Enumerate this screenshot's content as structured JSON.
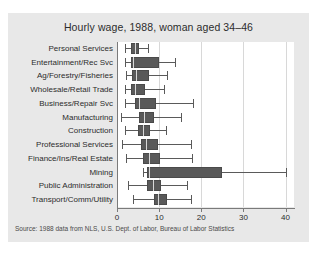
{
  "chart_data": {
    "type": "box",
    "title": "Hourly wage, 1988, woman aged 34–46",
    "xlabel": "",
    "ylabel": "",
    "xlim": [
      0,
      42
    ],
    "xticks": [
      0,
      10,
      20,
      30,
      40
    ],
    "xtick_labels": [
      "0",
      "10",
      "20",
      "30",
      "40"
    ],
    "grid": true,
    "grid_axis": "x",
    "legend": "none",
    "source_note": "Source: 1988 data from NLS, U.S. Dept. of Labor, Bureau of Labor Statistics",
    "categories": [
      "Personal Services",
      "Entertainment/Rec Svc",
      "Ag/Forestry/Fisheries",
      "Wholesale/Retail Trade",
      "Business/Repair Svc",
      "Manufacturing",
      "Construction",
      "Professional Services",
      "Finance/Ins/Real Estate",
      "Mining",
      "Public Administration",
      "Transport/Comm/Utility"
    ],
    "boxes": [
      {
        "category": "Personal Services",
        "whisker_low": 2.0,
        "q1": 3.4,
        "median": 4.3,
        "q3": 5.2,
        "whisker_high": 7.3
      },
      {
        "category": "Entertainment/Rec Svc",
        "whisker_low": 2.0,
        "q1": 3.3,
        "median": 3.7,
        "q3": 9.9,
        "whisker_high": 13.8
      },
      {
        "category": "Ag/Forestry/Fisheries",
        "whisker_low": 2.1,
        "q1": 3.6,
        "median": 4.4,
        "q3": 7.6,
        "whisker_high": 11.9
      },
      {
        "category": "Wholesale/Retail Trade",
        "whisker_low": 1.8,
        "q1": 3.4,
        "median": 4.3,
        "q3": 6.6,
        "whisker_high": 11.2
      },
      {
        "category": "Business/Repair Svc",
        "whisker_low": 1.8,
        "q1": 4.3,
        "median": 5.2,
        "q3": 9.3,
        "whisker_high": 18.0
      },
      {
        "category": "Manufacturing",
        "whisker_low": 0.9,
        "q1": 5.2,
        "median": 6.4,
        "q3": 8.7,
        "whisker_high": 15.1
      },
      {
        "category": "Construction",
        "whisker_low": 1.9,
        "q1": 5.1,
        "median": 6.1,
        "q3": 7.9,
        "whisker_high": 11.7
      },
      {
        "category": "Professional Services",
        "whisker_low": 1.3,
        "q1": 5.6,
        "median": 6.9,
        "q3": 9.8,
        "whisker_high": 17.6
      },
      {
        "category": "Finance/Ins/Real Estate",
        "whisker_low": 2.1,
        "q1": 6.2,
        "median": 7.5,
        "q3": 10.2,
        "whisker_high": 17.9
      },
      {
        "category": "Mining",
        "whisker_low": 6.1,
        "q1": 7.1,
        "median": 7.7,
        "q3": 24.9,
        "whisker_high": 40.0
      },
      {
        "category": "Public Administration",
        "whisker_low": 2.5,
        "q1": 7.2,
        "median": 8.6,
        "q3": 10.5,
        "whisker_high": 16.6
      },
      {
        "category": "Transport/Comm/Utility",
        "whisker_low": 3.9,
        "q1": 8.7,
        "median": 9.8,
        "q3": 11.8,
        "whisker_high": 17.6
      }
    ],
    "colors": {
      "box_fill": "#595959",
      "box_edge": "#4a4a4a",
      "median_line": "#d9d9d9",
      "whisker": "#5a5a5a",
      "plot_background": "#ffffff",
      "figure_background": "#e8e8e8",
      "gridline": "#d8d8d8",
      "axis": "#7a7a7a",
      "text": "#2c2c2c"
    }
  }
}
